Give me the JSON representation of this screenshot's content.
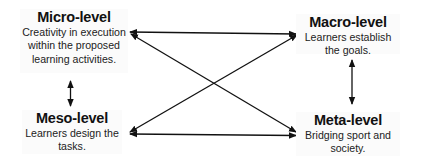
{
  "diagram": {
    "nodes": [
      {
        "id": "micro",
        "title": "Micro-level",
        "description": "Creativity in execution within the proposed learning activities."
      },
      {
        "id": "macro",
        "title": "Macro-level",
        "description": "Learners establish the goals."
      },
      {
        "id": "meso",
        "title": "Meso-level",
        "description": "Learners design the tasks."
      },
      {
        "id": "meta",
        "title": "Meta-level",
        "description": "Bridging sport and society."
      }
    ],
    "edges": [
      {
        "from": "micro",
        "to": "macro",
        "type": "bidirectional"
      },
      {
        "from": "meso",
        "to": "meta",
        "type": "bidirectional"
      },
      {
        "from": "micro",
        "to": "meta",
        "type": "bidirectional"
      },
      {
        "from": "meso",
        "to": "macro",
        "type": "bidirectional"
      },
      {
        "from": "micro",
        "to": "meso",
        "type": "bidirectional"
      },
      {
        "from": "macro",
        "to": "meta",
        "type": "bidirectional"
      }
    ],
    "colors": {
      "arrow": "#111111",
      "text": "#1a1a1a",
      "box_bg": "#fbfbfb"
    }
  }
}
